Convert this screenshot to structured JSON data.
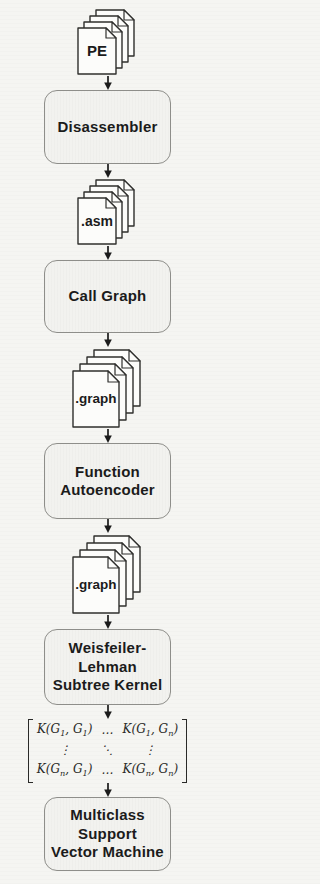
{
  "nodes": {
    "pe": {
      "label": "PE"
    },
    "disassembler": {
      "label": "Disassembler"
    },
    "asm": {
      "label": ".asm"
    },
    "call_graph": {
      "label": "Call Graph"
    },
    "graph1": {
      "label": ".graph"
    },
    "autoencoder": {
      "label": "Function\nAutoencoder"
    },
    "graph2": {
      "label": ".graph"
    },
    "wl_kernel": {
      "label": "Weisfeiler-\nLehman\nSubtree Kernel"
    },
    "svm": {
      "label": "Multiclass\nSupport\nVector Machine"
    }
  },
  "matrix": {
    "rows": [
      [
        "K(G_1, G_1)",
        "…",
        "K(G_1, G_n)"
      ],
      [
        "⋮",
        "⋱",
        "⋮"
      ],
      [
        "K(G_n, G_1)",
        "…",
        "K(G_n, G_n)"
      ]
    ]
  },
  "colors": {
    "bg": "#f5f5f2",
    "box_fill": "#f2f2ef",
    "box_border": "#8e8e8a",
    "ink": "#1b1b1b",
    "page_fill": "#fcfcfa",
    "page_stroke": "#2f2f2d",
    "arrow": "#1b1b1b",
    "matrix_ink": "#2a2a28"
  }
}
